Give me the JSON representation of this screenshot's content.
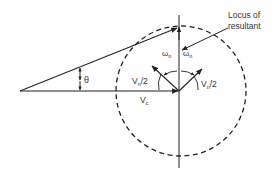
{
  "diagram": {
    "labels": {
      "locus_line1": "Locus of",
      "locus_line2": "resultant",
      "theta": "θ",
      "omega_left": "ω",
      "omega_left_sub": "n",
      "omega_right": "ω",
      "omega_right_sub": "n",
      "vn2_left": "V",
      "vn2_left_sub": "n",
      "vn2_left_tail": "/2",
      "vn2_right": "V",
      "vn2_right_sub": "n",
      "vn2_right_tail": "/2",
      "vc": "V",
      "vc_sub": "c"
    },
    "elements": [
      "carrier phasor Vc (horizontal)",
      "resultant phasor",
      "vertical axis",
      "dashed circle (locus of resultant)",
      "two counter-rotating sideband phasors Vn/2",
      "rotation arcs ωn",
      "angle θ"
    ],
    "colors": {
      "stroke": "#222222",
      "text": "#333333",
      "background": "#ffffff"
    }
  }
}
